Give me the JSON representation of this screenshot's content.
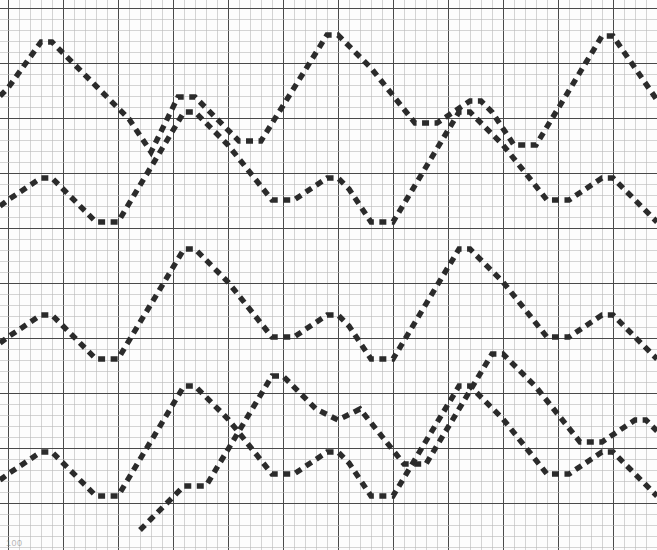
{
  "document": {
    "kind": "chart-recorder-strip",
    "title": "Dashed sawtooth traces on graph paper",
    "bottom_label": "100"
  },
  "colors": {
    "background": "#fdfdfd",
    "minor_grid": "#b9b9b9",
    "major_grid": "#4a4a4a",
    "trace": "#2b2b2b",
    "label": "#7d7d7d"
  },
  "grid": {
    "origin_x": 8,
    "origin_y": 8,
    "minor_step": 11,
    "major_every": 5,
    "width": 649,
    "height": 528,
    "minor_width": 0.6,
    "major_width": 1.1,
    "grid_on": true
  },
  "trace_style": {
    "stroke_width": 5.4,
    "dash_on": 7,
    "dash_off": 5.5,
    "linecap": "butt"
  },
  "chart_data": {
    "type": "line",
    "subtitle": "",
    "xlabel": "",
    "ylabel": "",
    "xlim": [
      0,
      657
    ],
    "ylim": [
      550,
      0
    ],
    "grid": true,
    "legend_position": "none",
    "annotations": [],
    "tick_labels_x": [],
    "tick_labels_y": [],
    "series": [
      {
        "name": "trace-1",
        "style": "dashed",
        "points": [
          [
            0,
            96
          ],
          [
            8,
            88
          ],
          [
            41,
            42
          ],
          [
            52,
            42
          ],
          [
            96,
            86
          ],
          [
            129,
            119
          ],
          [
            151,
            152
          ],
          [
            178,
            97
          ],
          [
            195,
            97
          ],
          [
            206,
            108
          ],
          [
            239,
            141
          ],
          [
            261,
            141
          ],
          [
            327,
            35
          ],
          [
            338,
            35
          ],
          [
            371,
            68
          ],
          [
            415,
            123
          ],
          [
            437,
            123
          ],
          [
            470,
            101
          ],
          [
            481,
            101
          ],
          [
            492,
            112
          ],
          [
            514,
            145
          ],
          [
            536,
            145
          ],
          [
            602,
            36
          ],
          [
            613,
            36
          ],
          [
            657,
            100
          ]
        ]
      },
      {
        "name": "trace-2",
        "style": "dashed",
        "points": [
          [
            0,
            206
          ],
          [
            8,
            200
          ],
          [
            41,
            178
          ],
          [
            52,
            178
          ],
          [
            63,
            189
          ],
          [
            96,
            222
          ],
          [
            118,
            222
          ],
          [
            184,
            112
          ],
          [
            195,
            112
          ],
          [
            228,
            145
          ],
          [
            272,
            200
          ],
          [
            294,
            200
          ],
          [
            327,
            178
          ],
          [
            338,
            178
          ],
          [
            349,
            189
          ],
          [
            371,
            222
          ],
          [
            393,
            222
          ],
          [
            459,
            112
          ],
          [
            470,
            112
          ],
          [
            503,
            145
          ],
          [
            547,
            200
          ],
          [
            569,
            200
          ],
          [
            602,
            178
          ],
          [
            613,
            178
          ],
          [
            624,
            189
          ],
          [
            657,
            222
          ]
        ]
      },
      {
        "name": "trace-3",
        "style": "dashed",
        "points": [
          [
            0,
            343
          ],
          [
            8,
            337
          ],
          [
            41,
            315
          ],
          [
            52,
            315
          ],
          [
            63,
            326
          ],
          [
            96,
            359
          ],
          [
            118,
            359
          ],
          [
            184,
            249
          ],
          [
            195,
            249
          ],
          [
            228,
            282
          ],
          [
            272,
            337
          ],
          [
            294,
            337
          ],
          [
            327,
            315
          ],
          [
            338,
            315
          ],
          [
            349,
            326
          ],
          [
            371,
            359
          ],
          [
            393,
            359
          ],
          [
            459,
            249
          ],
          [
            470,
            249
          ],
          [
            503,
            282
          ],
          [
            547,
            337
          ],
          [
            569,
            337
          ],
          [
            602,
            315
          ],
          [
            613,
            315
          ],
          [
            624,
            326
          ],
          [
            657,
            359
          ]
        ]
      },
      {
        "name": "trace-4",
        "style": "dashed",
        "points": [
          [
            0,
            480
          ],
          [
            8,
            474
          ],
          [
            41,
            452
          ],
          [
            52,
            452
          ],
          [
            63,
            463
          ],
          [
            96,
            496
          ],
          [
            118,
            496
          ],
          [
            184,
            386
          ],
          [
            195,
            386
          ],
          [
            228,
            419
          ],
          [
            272,
            474
          ],
          [
            294,
            474
          ],
          [
            327,
            452
          ],
          [
            338,
            452
          ],
          [
            349,
            463
          ],
          [
            371,
            496
          ],
          [
            393,
            496
          ],
          [
            459,
            386
          ],
          [
            470,
            386
          ],
          [
            503,
            419
          ],
          [
            547,
            474
          ],
          [
            569,
            474
          ],
          [
            602,
            452
          ],
          [
            613,
            452
          ],
          [
            624,
            463
          ],
          [
            657,
            496
          ]
        ]
      },
      {
        "name": "trace-5",
        "style": "dashed",
        "points": [
          [
            140,
            530
          ],
          [
            151,
            519
          ],
          [
            184,
            486
          ],
          [
            206,
            486
          ],
          [
            272,
            376
          ],
          [
            283,
            376
          ],
          [
            316,
            409
          ],
          [
            338,
            420
          ],
          [
            360,
            409
          ],
          [
            404,
            464
          ],
          [
            426,
            464
          ],
          [
            492,
            354
          ],
          [
            503,
            354
          ],
          [
            536,
            387
          ],
          [
            580,
            442
          ],
          [
            602,
            442
          ],
          [
            635,
            420
          ],
          [
            646,
            420
          ],
          [
            657,
            431
          ]
        ]
      }
    ]
  }
}
